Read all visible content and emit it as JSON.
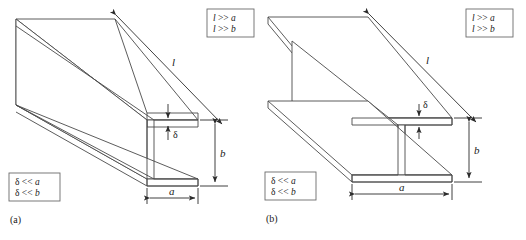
{
  "figure": {
    "background_color": "#ffffff",
    "line_color": "#4a4a4a",
    "dimension_color": "#2b2b2b",
    "panels": [
      {
        "caption": "(a)",
        "section_type": "channel",
        "length_label": "l",
        "width_label": "a",
        "height_label": "b",
        "thickness_label": "δ",
        "note_top": {
          "line1_lhs": "l",
          "line1_op": " >> ",
          "line1_rhs": "a",
          "line2_lhs": "l",
          "line2_op": " >> ",
          "line2_rhs": "b"
        },
        "note_bottom": {
          "line1_lhs": "δ",
          "line1_op": " << ",
          "line1_rhs": "a",
          "line2_lhs": "δ",
          "line2_op": " << ",
          "line2_rhs": "b"
        }
      },
      {
        "caption": "(b)",
        "section_type": "i-beam",
        "length_label": "l",
        "width_label": "a",
        "height_label": "b",
        "thickness_label": "δ",
        "note_top": {
          "line1_lhs": "l",
          "line1_op": " >> ",
          "line1_rhs": "a",
          "line2_lhs": "l",
          "line2_op": " >> ",
          "line2_rhs": "b"
        },
        "note_bottom": {
          "line1_lhs": "δ",
          "line1_op": " << ",
          "line1_rhs": "a",
          "line2_lhs": "δ",
          "line2_op": " << ",
          "line2_rhs": "b"
        }
      }
    ]
  }
}
